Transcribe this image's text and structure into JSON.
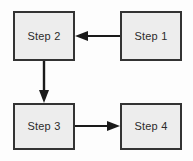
{
  "diagram": {
    "type": "flowchart",
    "width": 193,
    "height": 161,
    "background_color": "#fdfdfd",
    "node_fill_color": "#ededed",
    "node_border_color": "#333333",
    "connector_color": "#1a1a1a",
    "nodes": [
      {
        "id": "step1",
        "label": "Step 1",
        "x": 120,
        "y": 11,
        "width": 62,
        "height": 50
      },
      {
        "id": "step2",
        "label": "Step 2",
        "x": 13,
        "y": 11,
        "width": 62,
        "height": 50
      },
      {
        "id": "step3",
        "label": "Step 3",
        "x": 13,
        "y": 103,
        "width": 62,
        "height": 47
      },
      {
        "id": "step4",
        "label": "Step 4",
        "x": 120,
        "y": 103,
        "width": 62,
        "height": 47
      }
    ],
    "connectors": [
      {
        "id": "step1-to-step2",
        "from": "step1",
        "to": "step2",
        "direction": "left",
        "label": ""
      },
      {
        "id": "step2-to-step3",
        "from": "step2",
        "to": "step3",
        "direction": "down",
        "label": ""
      },
      {
        "id": "step3-to-step4",
        "from": "step3",
        "to": "step4",
        "direction": "right",
        "label": ""
      }
    ]
  }
}
